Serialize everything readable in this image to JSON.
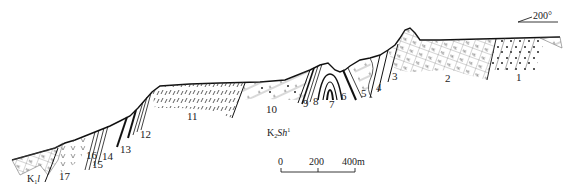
{
  "diagram": {
    "type": "geological-cross-section",
    "direction": {
      "azimuth_label": "200°"
    },
    "formations": [
      {
        "id": "K2Sh1",
        "base": "K",
        "sub": "2",
        "name": "Sh",
        "sup": "1"
      },
      {
        "id": "K1l",
        "base": "K",
        "sub": "1",
        "name": "l",
        "sup": ""
      }
    ],
    "layer_labels": [
      "1",
      "2",
      "3",
      "4",
      "5",
      "6",
      "7",
      "8",
      "9",
      "10",
      "11",
      "12",
      "13",
      "14",
      "15",
      "16",
      "17"
    ],
    "scale_bar": {
      "ticks": [
        "0",
        "200",
        "400m"
      ]
    }
  }
}
